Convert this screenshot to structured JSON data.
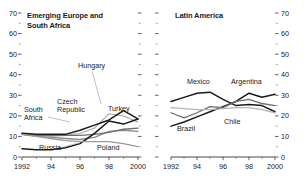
{
  "figure": {
    "background": "#ffffff",
    "axis_color": "#1a1a1a"
  },
  "panels": [
    {
      "id": "emerging-europe-south-africa",
      "title": "Emerging Europe and\nSouth Africa",
      "y_axis": {
        "min": 0,
        "max": 70,
        "ticks": [
          "0",
          "10",
          "20",
          "30",
          "40",
          "50",
          "60",
          "70"
        ],
        "minor_step": 5
      },
      "x_axis": {
        "min": 1992,
        "max": 2000,
        "ticks": [
          "1992",
          "94",
          "96",
          "98",
          "2000"
        ]
      },
      "series_labels": [
        {
          "name": "Hungary",
          "text": "Hungary"
        },
        {
          "name": "Czech Republic",
          "text": "Czech\nRepublic"
        },
        {
          "name": "South Africa",
          "text": "South\nAfrica"
        },
        {
          "name": "Turkey",
          "text": "Turkey"
        },
        {
          "name": "Russia",
          "text": "Russia"
        },
        {
          "name": "Poland",
          "text": "Poland"
        }
      ]
    },
    {
      "id": "latin-america",
      "title": "Latin America",
      "y_axis": {
        "min": 0,
        "max": 70,
        "ticks": [
          "0",
          "10",
          "20",
          "30",
          "40",
          "50",
          "60",
          "70"
        ],
        "minor_step": 5
      },
      "x_axis": {
        "min": 1992,
        "max": 2000,
        "ticks": [
          "1992",
          "94",
          "96",
          "98",
          "2000"
        ]
      },
      "series_labels": [
        {
          "name": "Mexico",
          "text": "Mexico"
        },
        {
          "name": "Argentina",
          "text": "Argentina"
        },
        {
          "name": "Brazil",
          "text": "Brazil"
        },
        {
          "name": "Chile",
          "text": "Chile"
        }
      ]
    }
  ],
  "chart_data": [
    {
      "type": "line",
      "title": "Emerging Europe and South Africa",
      "xlabel": "",
      "ylabel": "",
      "xlim": [
        1992,
        2000
      ],
      "ylim": [
        0,
        70
      ],
      "grid": false,
      "legend": "inline-labels",
      "x": [
        1992,
        1993,
        1994,
        1995,
        1996,
        1997,
        1998,
        1999,
        2000
      ],
      "series": [
        {
          "name": "Hungary",
          "color": "#b4b4b4",
          "values": [
            11.5,
            10.5,
            10.0,
            10.5,
            11.5,
            14.0,
            21.0,
            20.0,
            17.0
          ]
        },
        {
          "name": "Czech Republic",
          "color": "#8c8c8c",
          "values": [
            11.0,
            10.0,
            9.5,
            9.0,
            8.5,
            9.5,
            12.5,
            13.0,
            12.5
          ]
        },
        {
          "name": "South Africa",
          "color": "#6e6e6e",
          "values": [
            11.0,
            10.5,
            10.5,
            10.5,
            10.5,
            11.0,
            12.0,
            13.5,
            14.0
          ]
        },
        {
          "name": "Turkey",
          "color": "#1a1a1a",
          "values": [
            11.5,
            11.0,
            11.0,
            11.0,
            13.0,
            15.5,
            18.0,
            22.5,
            18.5
          ]
        },
        {
          "name": "Russia",
          "color": "#1a1a1a",
          "values": [
            4.0,
            3.5,
            3.5,
            4.5,
            6.5,
            11.5,
            17.5,
            16.0,
            18.5
          ]
        },
        {
          "name": "Poland",
          "color": "#9a9a9a",
          "values": [
            11.0,
            10.0,
            9.0,
            8.0,
            7.5,
            7.5,
            7.5,
            6.5,
            5.0
          ]
        }
      ]
    },
    {
      "type": "line",
      "title": "Latin America",
      "xlabel": "",
      "ylabel": "",
      "xlim": [
        1992,
        2000
      ],
      "ylim": [
        0,
        70
      ],
      "grid": false,
      "legend": "inline-labels",
      "x": [
        1992,
        1993,
        1994,
        1995,
        1996,
        1997,
        1998,
        1999,
        2000
      ],
      "series": [
        {
          "name": "Mexico",
          "color": "#1a1a1a",
          "values": [
            27.0,
            29.0,
            31.0,
            31.5,
            28.0,
            25.0,
            25.5,
            25.0,
            22.0
          ]
        },
        {
          "name": "Argentina",
          "color": "#1a1a1a",
          "values": [
            15.0,
            17.0,
            19.5,
            22.0,
            24.5,
            27.0,
            31.0,
            29.0,
            30.5
          ]
        },
        {
          "name": "Brazil",
          "color": "#6e6e6e",
          "values": [
            21.5,
            19.0,
            21.5,
            24.5,
            24.0,
            27.0,
            28.0,
            26.0,
            25.0
          ]
        },
        {
          "name": "Chile",
          "color": "#b4b4b4",
          "values": [
            24.0,
            23.5,
            23.0,
            23.0,
            23.5,
            24.0,
            24.0,
            23.0,
            21.5
          ]
        }
      ]
    }
  ]
}
